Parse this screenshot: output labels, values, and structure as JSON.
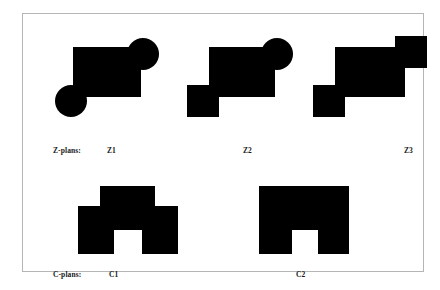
{
  "figure": {
    "background_color": "#ffffff",
    "frame_color": "#b5b5b5",
    "shape_fill_color": "#000000",
    "rows": [
      {
        "row_name": "Z-plans",
        "row_label": "Z-plans:",
        "items": [
          {
            "id": "z1",
            "label": "Z1",
            "description": "rectangle with round lobe at lower-left and round lobe at upper-right"
          },
          {
            "id": "z2",
            "label": "Z2",
            "description": "rectangle with square block at lower-left and round lobe at upper-right"
          },
          {
            "id": "z3",
            "label": "Z3",
            "description": "rectangle with square block at lower-left and square block at upper-right"
          }
        ]
      },
      {
        "row_name": "C-plans",
        "row_label": "C-plans:",
        "items": [
          {
            "id": "c1",
            "label": "C1",
            "description": "stepped block with narrow top tier over a wider tier, notch cut from bottom centre"
          },
          {
            "id": "c2",
            "label": "C2",
            "description": "single solid block with notch cut from bottom centre"
          }
        ]
      }
    ]
  },
  "shapes": {
    "z1": {
      "viewbox": "0 0 112 100",
      "body_rect": {
        "x": 22,
        "y": 11,
        "width": 68,
        "height": 50
      },
      "lobe_lower_left": {
        "type": "circle",
        "cx": 20,
        "cy": 65,
        "r": 16
      },
      "lobe_upper_right": {
        "type": "circle",
        "cx": 92,
        "cy": 18,
        "r": 16
      }
    },
    "z2": {
      "viewbox": "0 0 112 100",
      "body_rect": {
        "x": 22,
        "y": 11,
        "width": 66,
        "height": 50
      },
      "lobe_lower_left": {
        "type": "square",
        "x": 0,
        "y": 49,
        "width": 32,
        "height": 32
      },
      "lobe_upper_right": {
        "type": "circle",
        "cx": 90,
        "cy": 18,
        "r": 16
      }
    },
    "z3": {
      "viewbox": "0 0 120 100",
      "body_rect": {
        "x": 22,
        "y": 11,
        "width": 70,
        "height": 50
      },
      "lobe_lower_left": {
        "type": "square",
        "x": 0,
        "y": 49,
        "width": 32,
        "height": 32
      },
      "lobe_upper_right": {
        "type": "square",
        "x": 82,
        "y": 0,
        "width": 32,
        "height": 32
      }
    },
    "c1": {
      "viewbox": "0 0 100 70",
      "top_tier": {
        "x": 22,
        "y": 0,
        "width": 55,
        "height": 20
      },
      "bottom_tier": {
        "x": 0,
        "y": 20,
        "width": 100,
        "height": 48
      },
      "notch": {
        "x": 36,
        "y": 44,
        "width": 28,
        "height": 24
      }
    },
    "c2": {
      "viewbox": "0 0 90 70",
      "body": {
        "x": 0,
        "y": 0,
        "width": 90,
        "height": 68
      },
      "notch": {
        "x": 33,
        "y": 44,
        "width": 26,
        "height": 24
      }
    }
  }
}
